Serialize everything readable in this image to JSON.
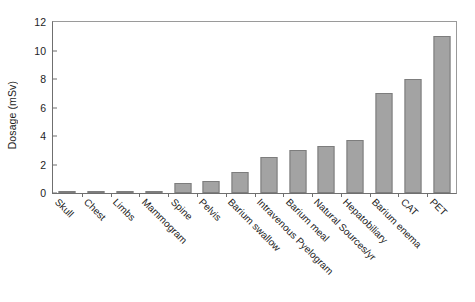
{
  "chart_data": {
    "type": "bar",
    "title": "",
    "xlabel": "",
    "ylabel": "Dosage (mSv)",
    "ylim": [
      0,
      12
    ],
    "yticks": [
      0,
      2,
      4,
      6,
      8,
      10,
      12
    ],
    "ytick_labels": [
      "0",
      "2",
      "4",
      "6",
      "8",
      "10",
      "12"
    ],
    "grid": false,
    "legend": false,
    "categories": [
      "Skull",
      "Chest",
      "Limbs",
      "Mammogram",
      "Spine",
      "Pelvis",
      "Barium swallow",
      "Intravenous Pyelogram",
      "Barium meal",
      "Natural Sources/yr",
      "Hepatobiliary",
      "Barium enema",
      "CAT",
      "PET"
    ],
    "values": [
      0.02,
      0.04,
      0.06,
      0.15,
      0.7,
      0.85,
      1.5,
      2.5,
      3.0,
      3.3,
      3.7,
      7.0,
      8.0,
      11.0
    ],
    "bar_color": "#a3a3a3",
    "bar_edge_color": "#7d7d7d",
    "axis_color": "#6f6f6f"
  }
}
